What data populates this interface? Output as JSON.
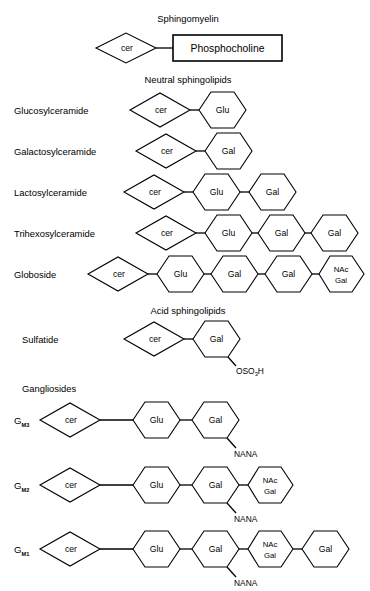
{
  "figure": {
    "title_visible": false,
    "background": "#ffffff",
    "line_color": "#000000"
  },
  "headings": {
    "sphingomyelin": "Sphingomyelin",
    "neutral": "Neutral sphingolipids",
    "acid": "Acid sphingolipids",
    "gangliosides": "Gangliosides"
  },
  "nodes": {
    "cer": "cer",
    "glu": "Glu",
    "gal": "Gal",
    "nac": "NAc",
    "nacgal_line2": "Gal",
    "phosphocholine": "Phosphocholine",
    "nana": "NANA",
    "oso3h_main": "OSO",
    "oso3h_sub": "3",
    "oso3h_tail": "H"
  },
  "rows": {
    "sphingomyelin": {
      "label": "",
      "units": [
        "cer",
        "Phosphocholine"
      ]
    },
    "glucosylceramide": {
      "label": "Glucosylceramide",
      "units": [
        "cer",
        "Glu"
      ]
    },
    "galactosylceramide": {
      "label": "Galactosylceramide",
      "units": [
        "cer",
        "Gal"
      ]
    },
    "lactosylceramide": {
      "label": "Lactosylceramide",
      "units": [
        "cer",
        "Glu",
        "Gal"
      ]
    },
    "trihexosylceramide": {
      "label": "Trihexosylceramide",
      "units": [
        "cer",
        "Glu",
        "Gal",
        "Gal"
      ]
    },
    "globoside": {
      "label": "Globoside",
      "units": [
        "cer",
        "Glu",
        "Gal",
        "Gal",
        "NAc Gal"
      ]
    },
    "sulfatide": {
      "label": "Sulfatide",
      "units": [
        "cer",
        "Gal"
      ],
      "substituent": "OSO3H"
    },
    "gm3": {
      "label": "G",
      "subscript": "M3",
      "units": [
        "cer",
        "Glu",
        "Gal"
      ],
      "substituent": "NANA"
    },
    "gm2": {
      "label": "G",
      "subscript": "M2",
      "units": [
        "cer",
        "Glu",
        "Gal",
        "NAc Gal"
      ],
      "substituent": "NANA"
    },
    "gm1": {
      "label": "G",
      "subscript": "M1",
      "units": [
        "cer",
        "Glu",
        "Gal",
        "NAc Gal",
        "Gal"
      ],
      "substituent": "NANA"
    }
  }
}
